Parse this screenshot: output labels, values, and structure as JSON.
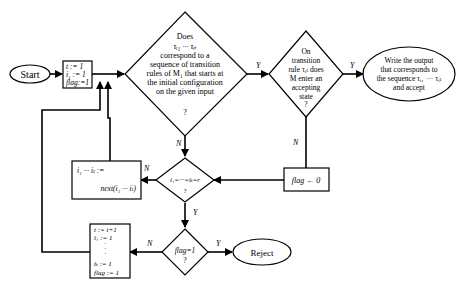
{
  "nodes": {
    "start": {
      "label": "Start"
    },
    "init": {
      "lines": [
        "t := 1",
        "i₁ := 1",
        "flag:=1"
      ]
    },
    "q1": {
      "lines": [
        "Does",
        "τᵢ₁ ··· τᵢₜ",
        "correspond to a",
        "sequence of transition",
        "rules of  M₁ that starts at",
        "the initial configuration",
        "on the given input",
        "?"
      ]
    },
    "q2": {
      "lines": [
        "On",
        "transition",
        "rule τᵢₜ does",
        "M  enter an",
        "accepting",
        "state",
        "?"
      ]
    },
    "accept": {
      "lines": [
        "Write the output",
        "that corresponds to",
        "the sequence τᵢ₁ ··· τᵢₜ",
        "and accept"
      ]
    },
    "flag0": {
      "label": "flag ← 0"
    },
    "q3": {
      "lines": [
        "i₁=···=iₜ=r",
        "?"
      ]
    },
    "next": {
      "lines": [
        "i₁ ··· iₜ :=",
        "next(i₁ ··· iₜ)"
      ]
    },
    "q4": {
      "lines": [
        "flag=1",
        "?"
      ]
    },
    "reject": {
      "label": "Reject"
    },
    "reset": {
      "lines": [
        "t := t+1",
        "i₁ := 1",
        "·",
        "·",
        "·",
        "iₜ := 1",
        "flag := 1"
      ]
    }
  },
  "edge_labels": {
    "q1_yes": "Y",
    "q1_no": "N",
    "q2_yes": "Y",
    "q2_no": "N",
    "q3_no": "N",
    "q3_yes": "Y",
    "q4_no": "N",
    "q4_yes": "Y"
  }
}
